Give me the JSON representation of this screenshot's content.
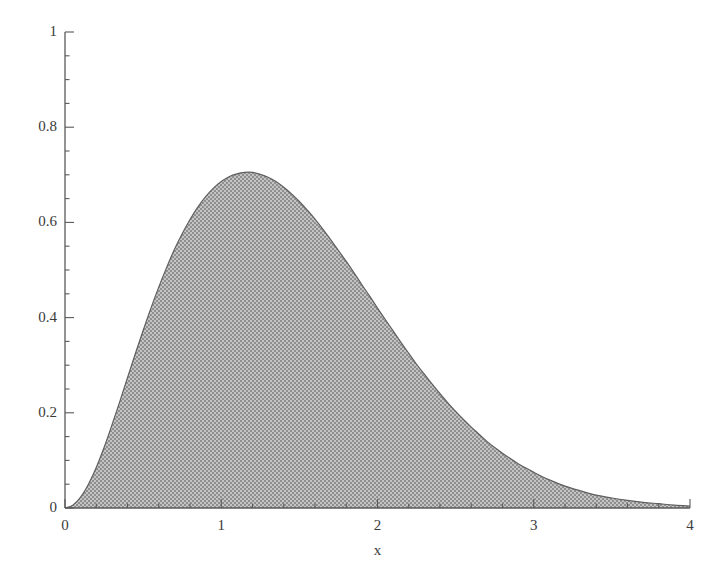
{
  "chart_data": {
    "type": "area",
    "title": "",
    "subtitle": "",
    "xlabel": "x",
    "ylabel": "",
    "xlim": [
      0,
      4
    ],
    "ylim": [
      0,
      1
    ],
    "grid": false,
    "legend": false,
    "x_major_ticks": [
      0,
      1,
      2,
      3,
      4
    ],
    "x_major_tick_labels": [
      "0",
      "1",
      "2",
      "3",
      "4"
    ],
    "x_minor_tick_step": 0.2,
    "y_major_ticks": [
      0,
      0.2,
      0.4,
      0.6,
      0.8,
      1
    ],
    "y_major_tick_labels": [
      "0",
      "0.2",
      "0.4",
      "0.6",
      "0.8",
      "1"
    ],
    "y_minor_tick_step": 0.05,
    "series": [
      {
        "name": "density",
        "fill": "#a9a9a9",
        "line": "#6b6b6b",
        "peak_x": 1.0,
        "peak_y": 0.735,
        "x": [
          0.0,
          0.05,
          0.1,
          0.15,
          0.2,
          0.25,
          0.3,
          0.35,
          0.4,
          0.45,
          0.5,
          0.55,
          0.6,
          0.65,
          0.7,
          0.75,
          0.8,
          0.85,
          0.9,
          0.95,
          1.0,
          1.05,
          1.1,
          1.15,
          1.2,
          1.25,
          1.3,
          1.35,
          1.4,
          1.45,
          1.5,
          1.55,
          1.6,
          1.65,
          1.7,
          1.75,
          1.8,
          1.85,
          1.9,
          1.95,
          2.0,
          2.05,
          2.1,
          2.15,
          2.2,
          2.25,
          2.3,
          2.35,
          2.4,
          2.45,
          2.5,
          2.55,
          2.6,
          2.65,
          2.7,
          2.75,
          2.8,
          2.85,
          2.9,
          2.95,
          3.0,
          3.1,
          3.2,
          3.3,
          3.4,
          3.5,
          3.6,
          3.7,
          3.8,
          3.9,
          4.0
        ],
        "y": [
          0.0,
          0.006,
          0.023,
          0.05,
          0.085,
          0.127,
          0.174,
          0.223,
          0.274,
          0.324,
          0.373,
          0.42,
          0.464,
          0.505,
          0.543,
          0.576,
          0.606,
          0.632,
          0.654,
          0.672,
          0.686,
          0.696,
          0.702,
          0.705,
          0.705,
          0.701,
          0.695,
          0.686,
          0.674,
          0.66,
          0.644,
          0.626,
          0.607,
          0.586,
          0.564,
          0.541,
          0.518,
          0.494,
          0.469,
          0.445,
          0.42,
          0.396,
          0.372,
          0.348,
          0.325,
          0.302,
          0.281,
          0.26,
          0.24,
          0.221,
          0.203,
          0.186,
          0.17,
          0.155,
          0.14,
          0.127,
          0.115,
          0.104,
          0.093,
          0.084,
          0.075,
          0.059,
          0.046,
          0.036,
          0.027,
          0.021,
          0.016,
          0.012,
          0.009,
          0.006,
          0.004
        ]
      }
    ]
  },
  "axes": {
    "x_axis_name": "x-axis",
    "y_axis_name": "y-axis",
    "x_title": "x"
  }
}
